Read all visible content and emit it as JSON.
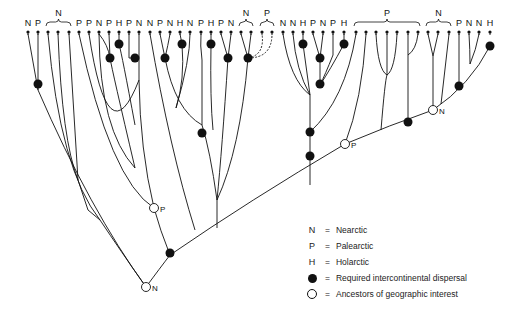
{
  "figure": {
    "type": "phylogenetic-biogeography-cladogram",
    "tip_labels": [
      {
        "x": 28,
        "label": "N"
      },
      {
        "x": 38,
        "label": "P"
      },
      {
        "x": 48,
        "label": ""
      },
      {
        "x": 58,
        "label": ""
      },
      {
        "x": 69,
        "label": ""
      },
      {
        "x": 79,
        "label": "P"
      },
      {
        "x": 89,
        "label": "P"
      },
      {
        "x": 99,
        "label": "N"
      },
      {
        "x": 109,
        "label": "P"
      },
      {
        "x": 119,
        "label": "H"
      },
      {
        "x": 129,
        "label": "P"
      },
      {
        "x": 139,
        "label": "N"
      },
      {
        "x": 150,
        "label": "N"
      },
      {
        "x": 160,
        "label": "P"
      },
      {
        "x": 170,
        "label": "N"
      },
      {
        "x": 180,
        "label": "H"
      },
      {
        "x": 190,
        "label": "N"
      },
      {
        "x": 201,
        "label": "P"
      },
      {
        "x": 211,
        "label": "H"
      },
      {
        "x": 221,
        "label": "P"
      },
      {
        "x": 231,
        "label": "N"
      },
      {
        "x": 241,
        "label": ""
      },
      {
        "x": 251,
        "label": ""
      },
      {
        "x": 262,
        "label": ""
      },
      {
        "x": 272,
        "label": ""
      },
      {
        "x": 283,
        "label": "N"
      },
      {
        "x": 293,
        "label": "N"
      },
      {
        "x": 303,
        "label": "H"
      },
      {
        "x": 313,
        "label": "P"
      },
      {
        "x": 323,
        "label": "N"
      },
      {
        "x": 333,
        "label": "P"
      },
      {
        "x": 344,
        "label": "H"
      },
      {
        "x": 356,
        "label": ""
      },
      {
        "x": 366,
        "label": ""
      },
      {
        "x": 376,
        "label": ""
      },
      {
        "x": 387,
        "label": ""
      },
      {
        "x": 397,
        "label": ""
      },
      {
        "x": 408,
        "label": ""
      },
      {
        "x": 418,
        "label": ""
      },
      {
        "x": 428,
        "label": ""
      },
      {
        "x": 438,
        "label": ""
      },
      {
        "x": 449,
        "label": ""
      },
      {
        "x": 459,
        "label": "P"
      },
      {
        "x": 469,
        "label": "N"
      },
      {
        "x": 479,
        "label": "N"
      },
      {
        "x": 490,
        "label": "H"
      }
    ],
    "brackets": [
      {
        "x1": 46,
        "x2": 71,
        "label": "N",
        "dashed": false
      },
      {
        "x1": 239,
        "x2": 253,
        "label": "N",
        "dashed": false
      },
      {
        "x1": 260,
        "x2": 274,
        "label": "P",
        "dashed": false
      },
      {
        "x1": 354,
        "x2": 420,
        "label": "P",
        "dashed": false
      },
      {
        "x1": 426,
        "x2": 451,
        "label": "N",
        "dashed": false
      }
    ],
    "node_annotations": [
      {
        "x": 154,
        "y": 208,
        "kind": "open",
        "label": "P"
      },
      {
        "x": 146,
        "y": 287,
        "kind": "open",
        "label": "N"
      },
      {
        "x": 345,
        "y": 144,
        "kind": "open",
        "label": "P"
      },
      {
        "x": 433,
        "y": 110,
        "kind": "open",
        "label": "N"
      }
    ]
  },
  "legend": {
    "items": [
      {
        "symbol": "N",
        "text": "Nearctic"
      },
      {
        "symbol": "P",
        "text": "Palearctic"
      },
      {
        "symbol": "H",
        "text": "Holarctic"
      },
      {
        "symbol": "filled-circle",
        "text": "Required intercontinental dispersal"
      },
      {
        "symbol": "open-circle",
        "text": "Ancestors of geographic interest"
      }
    ],
    "equals": "="
  }
}
